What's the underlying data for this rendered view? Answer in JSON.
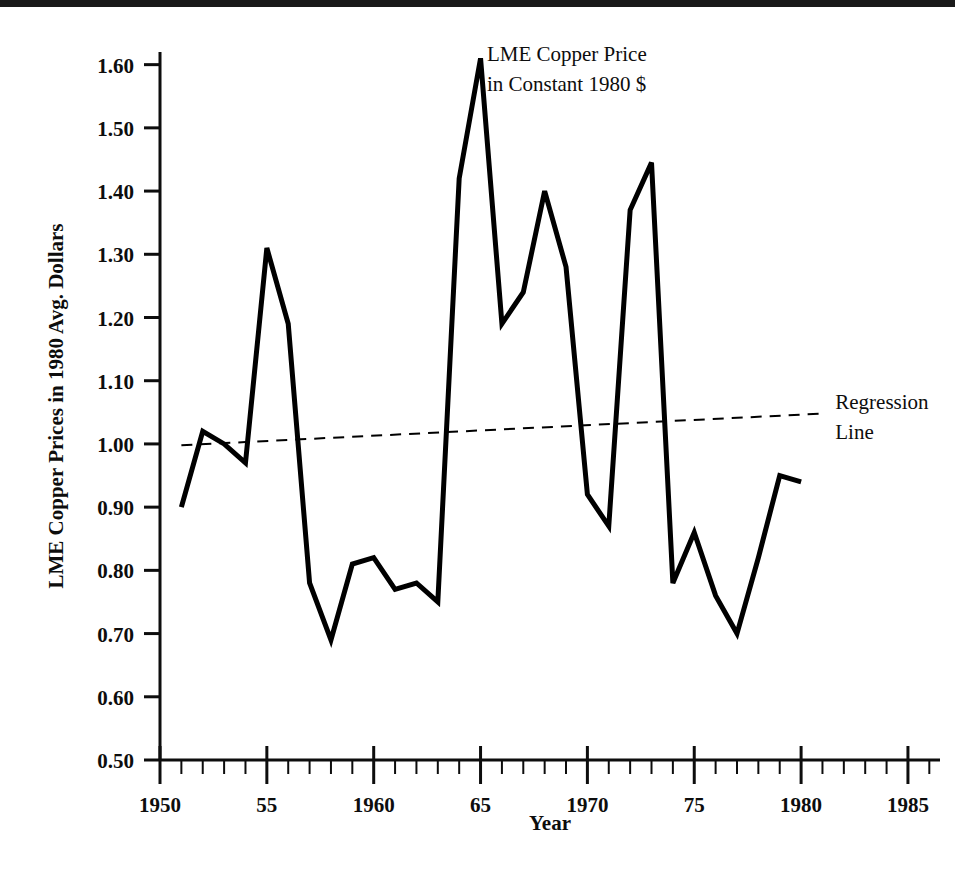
{
  "chart_data": {
    "type": "line",
    "title": "",
    "xlabel": "Year",
    "ylabel": "LME Copper Prices in 1980 Avg. Dollars",
    "xlim": [
      1950,
      1986.5
    ],
    "ylim": [
      0.5,
      1.62
    ],
    "grid": false,
    "legend_position": "none",
    "x_tick_labels": [
      "1950",
      "55",
      "1960",
      "65",
      "1970",
      "75",
      "1980",
      "1985"
    ],
    "x_tick_values": [
      1950,
      1955,
      1960,
      1965,
      1970,
      1975,
      1980,
      1985
    ],
    "x_minor_tick_step": 1,
    "y_tick_labels": [
      "0.50",
      "0.60",
      "0.70",
      "0.80",
      "0.90",
      "1.00",
      "1.10",
      "1.20",
      "1.30",
      "1.40",
      "1.50",
      "1.60"
    ],
    "y_tick_values": [
      0.5,
      0.6,
      0.7,
      0.8,
      0.9,
      1.0,
      1.1,
      1.2,
      1.3,
      1.4,
      1.5,
      1.6
    ],
    "series": [
      {
        "name": "LME Copper Price in Constant 1980 $",
        "style": "solid",
        "color": "#000000",
        "x": [
          1951,
          1952,
          1953,
          1954,
          1955,
          1956,
          1957,
          1958,
          1959,
          1960,
          1961,
          1962,
          1963,
          1964,
          1965,
          1966,
          1967,
          1968,
          1969,
          1970,
          1971,
          1972,
          1973,
          1974,
          1975,
          1976,
          1977,
          1978,
          1979,
          1980
        ],
        "values": [
          0.9,
          1.02,
          1.0,
          0.97,
          1.31,
          1.19,
          0.78,
          0.69,
          0.81,
          0.82,
          0.77,
          0.78,
          0.75,
          1.42,
          1.61,
          1.19,
          1.24,
          1.4,
          1.28,
          0.92,
          0.87,
          1.37,
          1.445,
          0.78,
          0.86,
          0.76,
          0.7,
          0.82,
          0.95,
          0.94
        ]
      },
      {
        "name": "Regression Line",
        "style": "dashed",
        "color": "#000000",
        "x": [
          1951,
          1981
        ],
        "values": [
          0.998,
          1.048
        ]
      }
    ],
    "annotations": [
      {
        "name": "series-label",
        "lines": [
          "LME Copper Price",
          "in Constant 1980 $"
        ],
        "x": 1965.3,
        "y": 1.605
      },
      {
        "name": "regression-label",
        "lines": [
          "Regression",
          "Line"
        ],
        "x": 1981.6,
        "y": 1.055
      }
    ]
  },
  "axis": {
    "x_title": "Year",
    "y_title": "LME Copper Prices in 1980 Avg. Dollars"
  },
  "colors": {
    "line": "#000000",
    "text": "#0d0d0d",
    "background": "#ffffff",
    "topbar": "#1a1a1a"
  }
}
